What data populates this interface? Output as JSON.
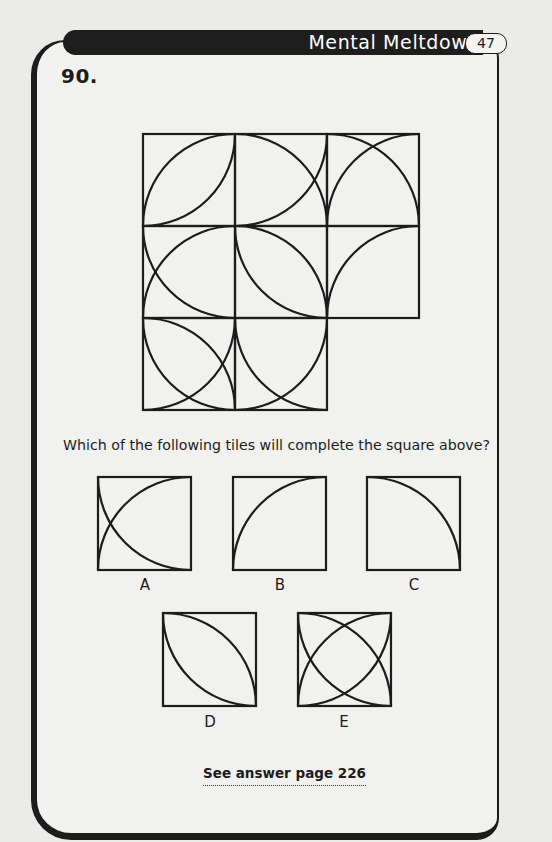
{
  "header": {
    "title": "Mental Meltdown",
    "page_number": "47"
  },
  "puzzle": {
    "number": "90.",
    "question": "Which of the following tiles will complete the square above?",
    "grid": {
      "rows": 3,
      "cols": 3,
      "missing_tile": {
        "row": 2,
        "col": 2
      },
      "tiles": [
        {
          "row": 0,
          "col": 0,
          "arcs": [
            "center-TL",
            "center-BR"
          ]
        },
        {
          "row": 0,
          "col": 1,
          "arcs": [
            "center-BL",
            "center-TL"
          ]
        },
        {
          "row": 0,
          "col": 2,
          "arcs": [
            "center-BL",
            "center-BR"
          ]
        },
        {
          "row": 1,
          "col": 0,
          "arcs": [
            "center-TR",
            "center-BR"
          ]
        },
        {
          "row": 1,
          "col": 1,
          "arcs": [
            "center-TR",
            "center-BL"
          ]
        },
        {
          "row": 1,
          "col": 2,
          "arcs": [
            "center-BR"
          ]
        },
        {
          "row": 2,
          "col": 0,
          "arcs": [
            "center-BL",
            "center-TR",
            "center-TL"
          ]
        },
        {
          "row": 2,
          "col": 1,
          "arcs": [
            "center-TR",
            "center-TL"
          ]
        }
      ]
    },
    "options": [
      {
        "label": "A",
        "arcs": [
          "center-BR",
          "center-TR"
        ]
      },
      {
        "label": "B",
        "arcs": [
          "center-BR"
        ]
      },
      {
        "label": "C",
        "arcs": [
          "center-BL"
        ]
      },
      {
        "label": "D",
        "arcs": [
          "center-BL",
          "center-TR"
        ]
      },
      {
        "label": "E",
        "arcs": [
          "center-TL",
          "center-BR",
          "center-TR",
          "center-BL"
        ]
      }
    ],
    "answer_reference": "See answer page 226"
  }
}
